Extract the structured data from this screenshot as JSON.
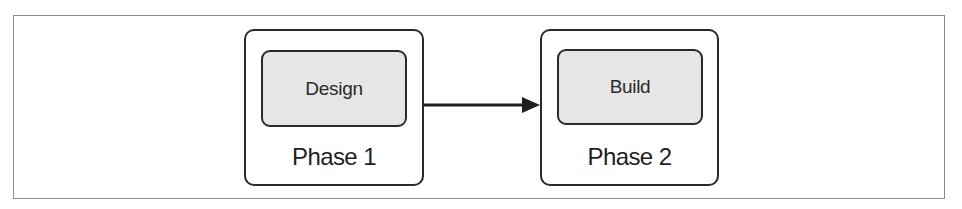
{
  "diagram": {
    "type": "process-flow",
    "phases": [
      {
        "label": "Phase 1",
        "task": "Design"
      },
      {
        "label": "Phase 2",
        "task": "Build"
      }
    ],
    "connector": {
      "from": "Phase 1",
      "to": "Phase 2",
      "style": "solid-arrow"
    },
    "colors": {
      "border": "#2a2a2a",
      "task_fill": "#e6e6e6",
      "frame": "#8a8a8a",
      "background": "#ffffff"
    }
  }
}
